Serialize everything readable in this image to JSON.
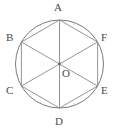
{
  "figure": {
    "name": "circle-with-inscribed-regular-hexagon",
    "background_color": "#ffffff",
    "stroke_color": "#7a7a7a",
    "label_color": "#4a4a4a",
    "circle": {
      "center_x": 59.5,
      "center_y": 64,
      "radius": 44,
      "stroke_width": 1
    },
    "center_point": {
      "label": "O",
      "x": 59.5,
      "y": 64,
      "dot_radius": 1.4
    },
    "vertices": [
      {
        "label": "A",
        "angle_deg": 90,
        "x": 59.5,
        "y": 20,
        "label_x": 56,
        "label_y": 3
      },
      {
        "label": "F",
        "angle_deg": 30,
        "x": 97.6,
        "y": 42,
        "label_x": 102,
        "label_y": 33
      },
      {
        "label": "E",
        "angle_deg": -30,
        "x": 97.6,
        "y": 86,
        "label_x": 102,
        "label_y": 86
      },
      {
        "label": "D",
        "angle_deg": -90,
        "x": 59.5,
        "y": 108,
        "label_x": 56,
        "label_y": 116
      },
      {
        "label": "C",
        "angle_deg": 210,
        "x": 21.4,
        "y": 86,
        "label_x": 7,
        "label_y": 86
      },
      {
        "label": "B",
        "angle_deg": 150,
        "x": 21.4,
        "y": 42,
        "label_x": 7,
        "label_y": 33
      }
    ],
    "hexagon_sides": [
      {
        "from": "A",
        "to": "F"
      },
      {
        "from": "F",
        "to": "E"
      },
      {
        "from": "E",
        "to": "D"
      },
      {
        "from": "D",
        "to": "C"
      },
      {
        "from": "C",
        "to": "B"
      },
      {
        "from": "B",
        "to": "A"
      }
    ],
    "diagonals": [
      {
        "from": "A",
        "to": "D"
      },
      {
        "from": "B",
        "to": "E"
      },
      {
        "from": "C",
        "to": "F"
      }
    ]
  }
}
